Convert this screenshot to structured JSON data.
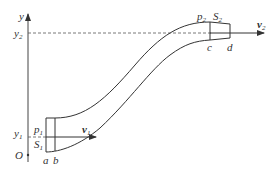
{
  "diagram": {
    "axis": {
      "y_label": "y",
      "origin_label": "O",
      "y1_label": "y",
      "y1_sub": "1",
      "y2_label": "y",
      "y2_sub": "2"
    },
    "inlet": {
      "pressure_label": "p",
      "pressure_sub": "1",
      "area_label": "S",
      "area_sub": "1",
      "velocity_label": "v",
      "velocity_sub": "1",
      "point_a": "a",
      "point_b": "b"
    },
    "outlet": {
      "pressure_label": "p",
      "pressure_sub": "2",
      "area_label": "S",
      "area_sub": "2",
      "velocity_label": "v",
      "velocity_sub": "2",
      "point_c": "c",
      "point_d": "d"
    },
    "colors": {
      "line": "#333333",
      "dashed": "#555555"
    }
  }
}
